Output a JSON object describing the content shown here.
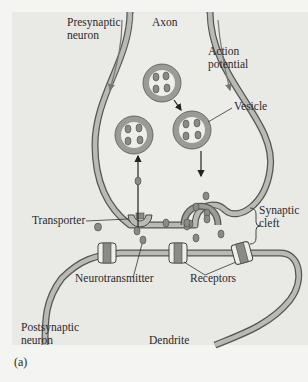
{
  "figure": {
    "caption": "(a)",
    "colors": {
      "background": "#e9e9e6",
      "membrane_fill": "#b9b9b5",
      "membrane_edge": "#555555",
      "vesicle_ring": "#9a9a96",
      "vesicle_inner": "#eeeeeb",
      "neurotransmitter": "#8a8a86",
      "arrow": "#222222"
    }
  },
  "labels": {
    "presynaptic": [
      "Presynaptic",
      "neuron"
    ],
    "axon": "Axon",
    "action_potential": [
      "Action",
      "potential"
    ],
    "vesicle": "Vesicle",
    "transporter": "Transporter",
    "synaptic_cleft": [
      "Synaptic",
      "cleft"
    ],
    "neurotransmitter": "Neurotransmitter",
    "receptors": "Receptors",
    "postsynaptic": [
      "Postsynaptic",
      "neuron"
    ],
    "dendrite": "Dendrite"
  }
}
